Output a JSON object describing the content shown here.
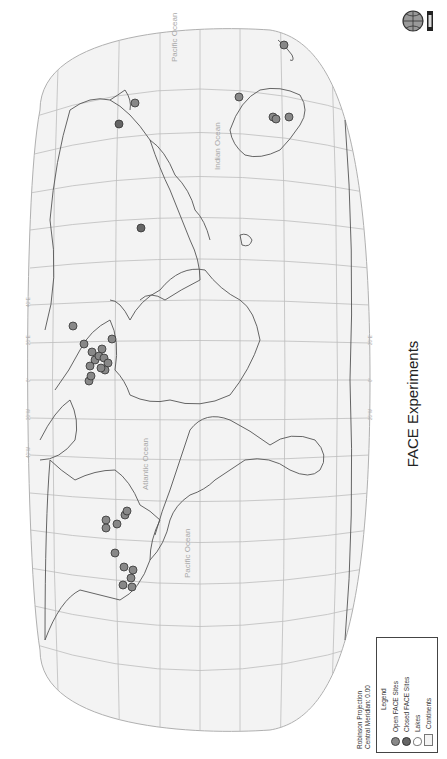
{
  "map": {
    "title": "FACE Experiments",
    "projection": "Robinson Projection",
    "central_meridian": "Central Meridian: 0.00",
    "orientation": "rotated 90 degrees counter-clockwise",
    "colors": {
      "background": "#ffffff",
      "ocean": "#f3f3f3",
      "graticule": "#b5b5b5",
      "coastline": "#555555",
      "open_site": "#888888",
      "closed_site": "#666666",
      "site_outline": "#333333",
      "ocean_label": "#a8a8a8"
    },
    "longitude_labels": [
      "180°",
      "160°W",
      "140°W",
      "120°W",
      "100°W",
      "80°W",
      "60°W",
      "40°W",
      "20°W",
      "0°",
      "20°E",
      "40°E",
      "60°E",
      "80°E",
      "100°E",
      "120°E",
      "140°E",
      "160°E",
      "180°"
    ],
    "latitude_labels": [
      "80°N",
      "60°N",
      "40°N",
      "20°N",
      "0°",
      "20°S",
      "40°S",
      "60°S",
      "80°S"
    ],
    "reference_lines": [
      "Tropic of Cancer",
      "Equator",
      "Tropic of Capricorn",
      "Antarctic Circle"
    ],
    "ocean_labels": [
      "Pacific Ocean",
      "Atlantic Ocean",
      "Indian Ocean",
      "Pacific Ocean"
    ]
  },
  "legend": {
    "heading": "Legend",
    "items": [
      {
        "label": "Open FACE Sites",
        "symbol": "open-site"
      },
      {
        "label": "Closed FACE Sites",
        "symbol": "closed-site"
      },
      {
        "label": "Lakes",
        "symbol": "lake"
      },
      {
        "label": "Continents",
        "symbol": "continent"
      }
    ]
  },
  "sites": [
    {
      "region": "North America (west)",
      "x": 123,
      "y": 585,
      "type": "open"
    },
    {
      "region": "North America (west)",
      "x": 131,
      "y": 578,
      "type": "open"
    },
    {
      "region": "North America (west)",
      "x": 133,
      "y": 570,
      "type": "open"
    },
    {
      "region": "North America (west)",
      "x": 124,
      "y": 567,
      "type": "open"
    },
    {
      "region": "North America (west)",
      "x": 132,
      "y": 587,
      "type": "open"
    },
    {
      "region": "North America (central)",
      "x": 115,
      "y": 553,
      "type": "open"
    },
    {
      "region": "North America (east)",
      "x": 106,
      "y": 520,
      "type": "open"
    },
    {
      "region": "North America (east)",
      "x": 106,
      "y": 528,
      "type": "open"
    },
    {
      "region": "North America (east)",
      "x": 117,
      "y": 524,
      "type": "open"
    },
    {
      "region": "North America (east)",
      "x": 125,
      "y": 515,
      "type": "open"
    },
    {
      "region": "North America (east)",
      "x": 127,
      "y": 511,
      "type": "open"
    },
    {
      "region": "Europe",
      "x": 73,
      "y": 326,
      "type": "open"
    },
    {
      "region": "Europe",
      "x": 84,
      "y": 344,
      "type": "open"
    },
    {
      "region": "Europe",
      "x": 92,
      "y": 352,
      "type": "open"
    },
    {
      "region": "Europe",
      "x": 95,
      "y": 360,
      "type": "open"
    },
    {
      "region": "Europe",
      "x": 90,
      "y": 366,
      "type": "open"
    },
    {
      "region": "Europe",
      "x": 99,
      "y": 356,
      "type": "open"
    },
    {
      "region": "Europe",
      "x": 102,
      "y": 349,
      "type": "open"
    },
    {
      "region": "Europe",
      "x": 104,
      "y": 358,
      "type": "open"
    },
    {
      "region": "Europe",
      "x": 108,
      "y": 363,
      "type": "open"
    },
    {
      "region": "Europe",
      "x": 112,
      "y": 339,
      "type": "open"
    },
    {
      "region": "Europe",
      "x": 105,
      "y": 370,
      "type": "open"
    },
    {
      "region": "Europe",
      "x": 89,
      "y": 381,
      "type": "open"
    },
    {
      "region": "Europe",
      "x": 91,
      "y": 376,
      "type": "open"
    },
    {
      "region": "Europe",
      "x": 101,
      "y": 368,
      "type": "open"
    },
    {
      "region": "Asia (China)",
      "x": 141,
      "y": 228,
      "type": "closed"
    },
    {
      "region": "Asia (Japan)",
      "x": 119,
      "y": 124,
      "type": "closed"
    },
    {
      "region": "Asia (Japan)",
      "x": 135,
      "y": 103,
      "type": "open"
    },
    {
      "region": "Australia",
      "x": 239,
      "y": 97,
      "type": "open"
    },
    {
      "region": "Australia",
      "x": 273,
      "y": 117,
      "type": "open"
    },
    {
      "region": "Australia",
      "x": 276,
      "y": 119,
      "type": "open"
    },
    {
      "region": "Australia",
      "x": 289,
      "y": 117,
      "type": "open"
    },
    {
      "region": "New Zealand",
      "x": 284,
      "y": 45,
      "type": "open"
    }
  ]
}
